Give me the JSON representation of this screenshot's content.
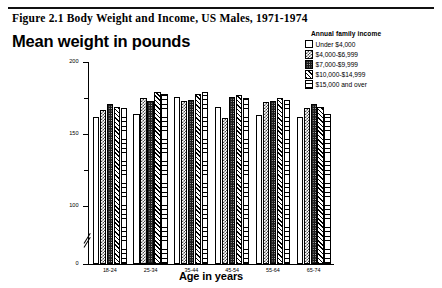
{
  "figure": {
    "caption": "Figure 2.1  Body Weight and Income, US Males, 1971-1974",
    "chart_title": "Mean weight in pounds"
  },
  "legend": {
    "title": "Annual family income",
    "items": [
      {
        "label": "Under $4,000",
        "pattern": "empty"
      },
      {
        "label": "$4,000-$6,999",
        "pattern": "check"
      },
      {
        "label": "$7,000-$9,999",
        "pattern": "dark"
      },
      {
        "label": "$10,000-$14,999",
        "pattern": "diag"
      },
      {
        "label": "$15,000 and over",
        "pattern": "ladder"
      }
    ]
  },
  "axes": {
    "y_ticks_major": [
      "200",
      "150",
      "100",
      "0"
    ],
    "y_ticks_minor": [
      "175",
      "125"
    ],
    "x_title": "Age in years"
  },
  "chart_data": {
    "type": "bar",
    "title": "Mean weight in pounds",
    "xlabel": "Age in years",
    "ylabel": "Mean weight in pounds",
    "ylim": [
      0,
      200
    ],
    "y_axis_break": true,
    "y_break_below": 100,
    "grid": false,
    "legend_position": "top-right",
    "categories": [
      "18-24",
      "25-34",
      "35-44",
      "45-54",
      "55-64",
      "65-74"
    ],
    "series": [
      {
        "name": "Under $4,000",
        "values": [
          161,
          163,
          175,
          168,
          162,
          161
        ]
      },
      {
        "name": "$4,000-$6,999",
        "values": [
          166,
          174,
          172,
          160,
          171,
          167
        ]
      },
      {
        "name": "$7,000-$9,999",
        "values": [
          170,
          172,
          173,
          175,
          172,
          170
        ]
      },
      {
        "name": "$10,000-$14,999",
        "values": [
          168,
          178,
          177,
          176,
          174,
          168
        ]
      },
      {
        "name": "$15,000 and over",
        "values": [
          167,
          177,
          178,
          174,
          173,
          163
        ]
      }
    ]
  }
}
